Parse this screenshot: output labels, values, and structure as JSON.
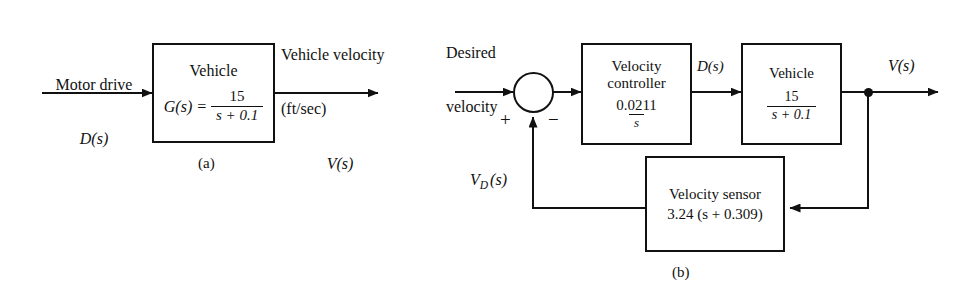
{
  "figure": {
    "background": "#ffffff",
    "ink": "#111111"
  },
  "diagram_a": {
    "caption": "(a)",
    "input_label_line1": "Motor drive",
    "input_label_line2": "D(s)",
    "output_label_line1": "Vehicle velocity",
    "output_label_line2": "(ft/sec)",
    "output_label_line3": "V(s)",
    "block": {
      "title": "Vehicle",
      "equation_lhs": "G(s) =",
      "numerator": "15",
      "denominator": "s + 0.1"
    }
  },
  "diagram_b": {
    "caption": "(b)",
    "input_label_line1": "Desired",
    "input_label_line2": "velocity",
    "input_symbol_base": "V",
    "input_symbol_sub": "D",
    "input_symbol_tail": "(s)",
    "sum_plus": "+",
    "sum_minus": "−",
    "mid_signal_label": "D(s)",
    "output_label": "V(s)",
    "controller": {
      "title_line1": "Velocity",
      "title_line2": "controller",
      "numerator": "0.0211",
      "denominator": "s"
    },
    "vehicle": {
      "title": "Vehicle",
      "numerator": "15",
      "denominator": "s + 0.1"
    },
    "sensor": {
      "title": "Velocity sensor",
      "gain_expression": "3.24 (s + 0.309)"
    }
  }
}
